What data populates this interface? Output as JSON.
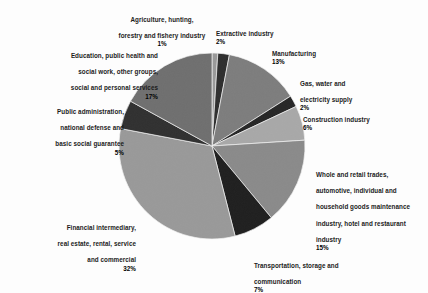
{
  "chart_data": {
    "type": "pie",
    "title": "",
    "subtitle": "",
    "xlabel": "",
    "ylabel": "",
    "legend_position": "labels-around-pie",
    "grid": false,
    "start_angle_deg": 0,
    "direction": "clockwise",
    "units": "percent",
    "categories": [
      "Agriculture, hunting, forestry and fishery industry",
      "Extractive industry",
      "Manufacturing",
      "Gas, water and electricity supply",
      "Construction industry",
      "Whole and retail trades, automotive, individual and household goods maintenance industry, hotel and restaurant industry",
      "Transportation, storage and communication",
      "Financial intermediary, real estate, rental, service and commercial",
      "Public administration, national defense and basic social guarantee",
      "Education, public health and social work, other groups, social and personal services"
    ],
    "values": [
      1,
      2,
      13,
      2,
      6,
      15,
      7,
      32,
      5,
      17
    ],
    "colors": [
      "#9a9a9a",
      "#2e2e2e",
      "#7d7d7d",
      "#262626",
      "#a8a8a8",
      "#8a8a8a",
      "#1f1f1f",
      "#999999",
      "#303030",
      "#6f6f6f"
    ]
  },
  "labels": {
    "agriculture": {
      "line1": "Agriculture, hunting,",
      "line2": "forestry and fishery industry",
      "pct": "1%"
    },
    "extractive": {
      "line1": "Extractive industry",
      "pct": "2%"
    },
    "manufacturing": {
      "line1": "Manufacturing",
      "pct": "13%"
    },
    "gas": {
      "line1": "Gas, water and",
      "line2": "electricity supply",
      "pct": "2%"
    },
    "construction": {
      "line1": "Construction industry",
      "pct": "6%"
    },
    "wholesale": {
      "line1": "Whole and retail trades,",
      "line2": "automotive, individual and",
      "line3": "household goods maintenance",
      "line4": "industry, hotel and restaurant",
      "line5": "industry",
      "pct": "15%"
    },
    "transport": {
      "line1": "Transportation, storage and",
      "line2": "communication",
      "pct": "7%"
    },
    "financial": {
      "line1": "Financial intermediary,",
      "line2": "real estate, rental, service",
      "line3": "and commercial",
      "pct": "32%"
    },
    "publicadmin": {
      "line1": "Public administration,",
      "line2": "national defense and",
      "line3": "basic social guarantee",
      "pct": "5%"
    },
    "education": {
      "line1": "Education, public health and",
      "line2": "social work, other groups,",
      "line3": "social and personal services",
      "pct": "17%"
    }
  }
}
